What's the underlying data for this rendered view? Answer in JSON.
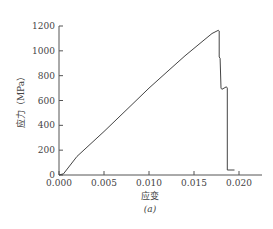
{
  "chart_data": {
    "type": "line",
    "title": "",
    "caption": "(a)",
    "xlabel": "应变",
    "ylabel": "应力（MPa）",
    "xlim": [
      0,
      0.0225
    ],
    "ylim": [
      0,
      1200
    ],
    "xticks": [
      "0.000",
      "0.005",
      "0.010",
      "0.015",
      "0.020"
    ],
    "yticks": [
      "0",
      "200",
      "400",
      "600",
      "800",
      "1000",
      "1200"
    ],
    "grid": false,
    "series": [
      {
        "name": "stress-strain",
        "color": "#444444",
        "x": [
          0.0,
          0.0005,
          0.002,
          0.005,
          0.008,
          0.01,
          0.012,
          0.014,
          0.016,
          0.017,
          0.0177,
          0.0178,
          0.0178,
          0.0179,
          0.018,
          0.0181,
          0.0186,
          0.0187,
          0.0187,
          0.0195
        ],
        "y": [
          0,
          10,
          150,
          350,
          560,
          700,
          830,
          960,
          1080,
          1140,
          1165,
          1160,
          950,
          940,
          700,
          690,
          710,
          700,
          40,
          40
        ]
      }
    ]
  }
}
